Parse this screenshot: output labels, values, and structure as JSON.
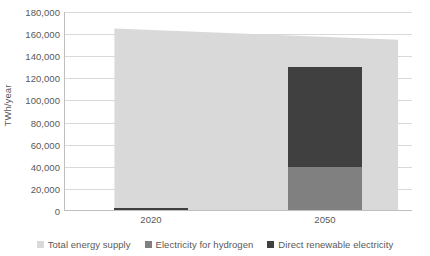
{
  "chart_data": {
    "type": "bar",
    "title": "",
    "subtitle": "",
    "xlabel": "",
    "ylabel": "TWh/year",
    "categories": [
      "2020",
      "2050"
    ],
    "ylim": [
      0,
      180000
    ],
    "ytick_step": 20000,
    "ytick_labels": [
      "180,000",
      "160,000",
      "140,000",
      "120,000",
      "100,000",
      "80,000",
      "60,000",
      "40,000",
      "20,000",
      "0"
    ],
    "ytick_values": [
      180000,
      160000,
      140000,
      120000,
      100000,
      80000,
      60000,
      40000,
      20000,
      0
    ],
    "grid": true,
    "legend_position": "bottom",
    "series": [
      {
        "name": "Total energy supply",
        "type": "area",
        "color": "#d9d9d9",
        "values": [
          165000,
          155000
        ]
      },
      {
        "name": "Electricity for hydrogen",
        "type": "bar",
        "stacked": true,
        "color": "#808080",
        "values": [
          0,
          40000
        ]
      },
      {
        "name": "Direct renewable electricity",
        "type": "bar",
        "stacked": true,
        "color": "#404040",
        "values": [
          3000,
          90000
        ]
      }
    ],
    "annotations": []
  },
  "legend": {
    "items": [
      {
        "label": "Total energy supply",
        "color": "#d9d9d9"
      },
      {
        "label": "Electricity for hydrogen",
        "color": "#808080"
      },
      {
        "label": "Direct renewable electricity",
        "color": "#404040"
      }
    ]
  },
  "colors": {
    "total_energy_supply": "#d9d9d9",
    "electricity_for_hydrogen": "#808080",
    "direct_renewable_electricity": "#404040",
    "gridline": "#d9d9d9",
    "axis": "#bfbfbf",
    "text": "#595959",
    "background": "#ffffff"
  }
}
